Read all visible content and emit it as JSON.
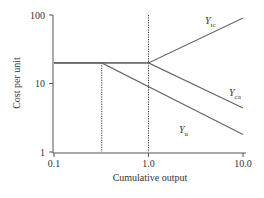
{
  "chart_data": {
    "type": "line",
    "title": "",
    "xlabel": "Cumulative output",
    "ylabel": "Cost per unit",
    "xscale": "log",
    "yscale": "log",
    "xlim": [
      0.1,
      10.0
    ],
    "ylim": [
      1,
      100
    ],
    "x_ticks": [
      "0.1",
      "1.0",
      "10.0"
    ],
    "y_ticks": [
      "1",
      "10",
      "100"
    ],
    "grid": false,
    "legend": "inline labels",
    "series": [
      {
        "name": "Y_tc",
        "label_main": "Y",
        "label_sub": "tc",
        "points": [
          [
            0.1,
            20
          ],
          [
            1.0,
            20
          ],
          [
            10.0,
            90
          ]
        ]
      },
      {
        "name": "Y_ca",
        "label_main": "Y",
        "label_sub": "ca",
        "points": [
          [
            0.1,
            20
          ],
          [
            1.0,
            20
          ],
          [
            10.0,
            4.4
          ]
        ]
      },
      {
        "name": "Y_u",
        "label_main": "Y",
        "label_sub": "u",
        "points": [
          [
            0.1,
            20
          ],
          [
            0.32,
            20
          ],
          [
            10.0,
            1.8
          ]
        ]
      }
    ],
    "annotations": [
      {
        "type": "vertical-dotted-line",
        "x": 0.32,
        "from_y": 1,
        "to_y": 20
      },
      {
        "type": "vertical-dotted-line",
        "x": 1.0,
        "from_y": 1,
        "to_y": 100
      }
    ]
  },
  "colors": {
    "axis": "#555555",
    "line": "#666666",
    "text": "#333333",
    "background": "#ffffff"
  }
}
